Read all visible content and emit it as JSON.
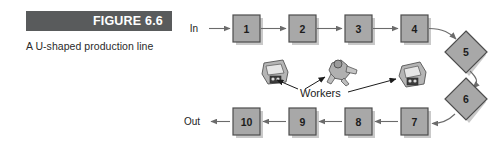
{
  "figure": {
    "banner_label": "FIGURE 6.6",
    "caption": "A U-shaped production line",
    "banner_color": "#595b5c",
    "banner_text_color": "#ffffff"
  },
  "diagram": {
    "colors": {
      "station_fill": "#a8a8a8",
      "station_stroke": "#4d4d4d",
      "shadow": "#c9c9c9",
      "arrow": "#6b6b6b",
      "text": "#1c1c1c"
    },
    "io": {
      "in_label": "In",
      "out_label": "Out"
    },
    "workers_label": "Workers",
    "top_row": [
      {
        "label": "1",
        "shape": "square",
        "x": 233,
        "y": 15
      },
      {
        "label": "2",
        "shape": "square",
        "x": 289,
        "y": 15
      },
      {
        "label": "3",
        "shape": "square",
        "x": 345,
        "y": 15
      },
      {
        "label": "4",
        "shape": "square",
        "x": 401,
        "y": 15
      }
    ],
    "right_column": [
      {
        "label": "5",
        "shape": "diamond",
        "cx": 466,
        "cy": 52
      },
      {
        "label": "6",
        "shape": "diamond",
        "cx": 466,
        "cy": 99
      }
    ],
    "bottom_row": [
      {
        "label": "7",
        "shape": "square",
        "x": 401,
        "y": 108
      },
      {
        "label": "8",
        "shape": "square",
        "x": 345,
        "y": 108
      },
      {
        "label": "9",
        "shape": "square",
        "x": 289,
        "y": 108
      },
      {
        "label": "10",
        "shape": "square",
        "x": 233,
        "y": 108
      }
    ],
    "workers": [
      {
        "id": "worker-left",
        "x": 262,
        "y": 60
      },
      {
        "id": "worker-center",
        "x": 328,
        "y": 60
      },
      {
        "id": "worker-right",
        "x": 400,
        "y": 62
      }
    ]
  }
}
